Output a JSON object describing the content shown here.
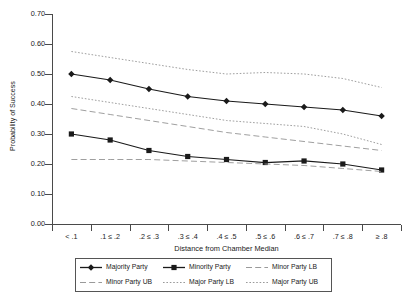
{
  "chart_data": {
    "type": "line",
    "title": "",
    "xlabel": "Distance from Chamber Median",
    "ylabel": "Probability of Success",
    "categories": [
      "< .1",
      ".1 ≤ .2",
      ".2 ≤ .3",
      ".3 ≤ .4",
      ".4 ≤ .5",
      ".5 ≤ .6",
      ".6 ≤ .7",
      ".7 ≤ .8",
      "≥ .8"
    ],
    "ylim": [
      0.0,
      0.7
    ],
    "yticks": [
      0.0,
      0.1,
      0.2,
      0.3,
      0.4,
      0.5,
      0.6,
      0.7
    ],
    "ytick_labels": [
      "0.00",
      "0.10",
      "0.20",
      "0.30",
      "0.40",
      "0.50",
      "0.60",
      "0.70"
    ],
    "grid": false,
    "legend_position": "bottom",
    "series": [
      {
        "name": "Majority Party",
        "style": "solid",
        "marker": "diamond",
        "color": "#1a1a1a",
        "values": [
          0.5,
          0.48,
          0.45,
          0.425,
          0.41,
          0.4,
          0.39,
          0.38,
          0.36
        ]
      },
      {
        "name": "Minority Party",
        "style": "solid",
        "marker": "square",
        "color": "#1a1a1a",
        "values": [
          0.3,
          0.28,
          0.245,
          0.225,
          0.215,
          0.205,
          0.21,
          0.2,
          0.18
        ]
      },
      {
        "name": "Minor Party LB",
        "style": "dashed",
        "marker": "none",
        "color": "#9a9a9a",
        "values": [
          0.215,
          0.215,
          0.215,
          0.21,
          0.205,
          0.2,
          0.195,
          0.185,
          0.175
        ]
      },
      {
        "name": "Minor Party UB",
        "style": "dashed",
        "marker": "none",
        "color": "#9a9a9a",
        "values": [
          0.385,
          0.365,
          0.345,
          0.325,
          0.305,
          0.29,
          0.275,
          0.26,
          0.245
        ]
      },
      {
        "name": "Major Party LB",
        "style": "dotted",
        "marker": "none",
        "color": "#9a9a9a",
        "values": [
          0.425,
          0.405,
          0.385,
          0.365,
          0.345,
          0.335,
          0.325,
          0.3,
          0.265
        ]
      },
      {
        "name": "Major Party UB",
        "style": "dotted",
        "marker": "none",
        "color": "#9a9a9a",
        "values": [
          0.575,
          0.555,
          0.535,
          0.515,
          0.5,
          0.505,
          0.5,
          0.485,
          0.455
        ]
      }
    ]
  },
  "legend": {
    "entries": [
      {
        "label": "Majority Party"
      },
      {
        "label": "Minority Party"
      },
      {
        "label": "Minor Party LB"
      },
      {
        "label": "Minor Party UB"
      },
      {
        "label": "Major Party LB"
      },
      {
        "label": "Major Party UB"
      }
    ]
  },
  "colors": {
    "axis": "#4a4a4a",
    "primary_series": "#1a1a1a",
    "band": "#9a9a9a",
    "background": "#ffffff"
  }
}
